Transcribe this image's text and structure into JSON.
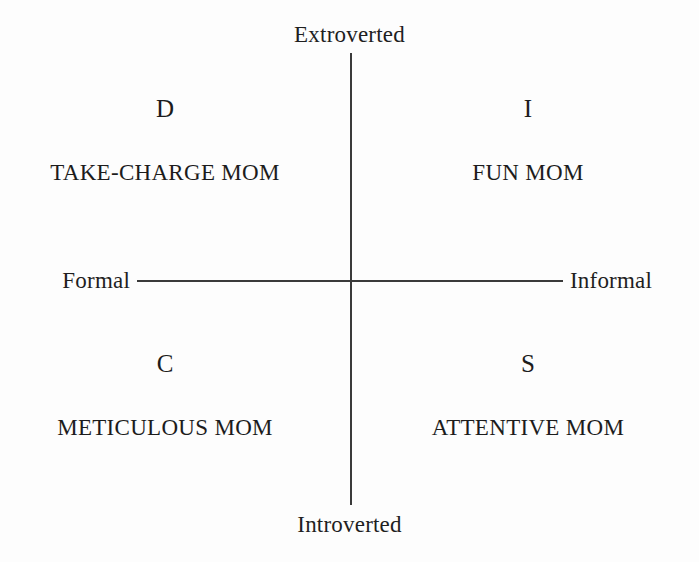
{
  "diagram": {
    "type": "2x2-quadrant",
    "background_color": "#fdfdfd",
    "line_color": "#3a3a3a",
    "text_color": "#1c1c1c"
  },
  "axes": {
    "vertical": {
      "top_label": "Extroverted",
      "bottom_label": "Introverted"
    },
    "horizontal": {
      "left_label": "Formal",
      "right_label": "Informal"
    }
  },
  "quadrants": [
    {
      "letter": "D",
      "name": "TAKE-CHARGE MOM",
      "position": "top-left",
      "vertical_pole": "Extroverted",
      "horizontal_pole": "Formal"
    },
    {
      "letter": "I",
      "name": "FUN MOM",
      "position": "top-right",
      "vertical_pole": "Extroverted",
      "horizontal_pole": "Informal"
    },
    {
      "letter": "C",
      "name": "METICULOUS MOM",
      "position": "bottom-left",
      "vertical_pole": "Introverted",
      "horizontal_pole": "Formal"
    },
    {
      "letter": "S",
      "name": "ATTENTIVE MOM",
      "position": "bottom-right",
      "vertical_pole": "Introverted",
      "horizontal_pole": "Informal"
    }
  ]
}
